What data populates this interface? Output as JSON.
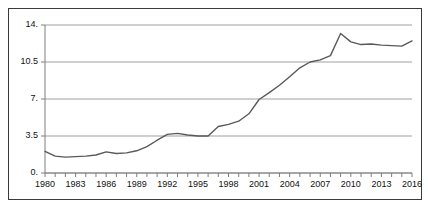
{
  "chart_data": {
    "type": "line",
    "title": "",
    "subtitle": "",
    "xlabel": "",
    "ylabel": "",
    "xlim": [
      1980,
      2016
    ],
    "ylim": [
      0,
      14
    ],
    "grid": true,
    "legend": false,
    "legend_position": "none",
    "line_color": "#595959",
    "gridline_color": "#9f9f9f",
    "axis_color": "#7f7f7f",
    "y_ticks": [
      "0.",
      "3.5",
      "7.",
      "10.5",
      "14."
    ],
    "y_tick_values": [
      0,
      3.5,
      7,
      10.5,
      14
    ],
    "x_ticks": [
      "1980",
      "1983",
      "1986",
      "1989",
      "1992",
      "1995",
      "1998",
      "2001",
      "2004",
      "2007",
      "2010",
      "2013",
      "2016"
    ],
    "x_tick_values": [
      1980,
      1983,
      1986,
      1989,
      1992,
      1995,
      1998,
      2001,
      2004,
      2007,
      2010,
      2013,
      2016
    ],
    "x": [
      1980,
      1981,
      1982,
      1983,
      1984,
      1985,
      1986,
      1987,
      1988,
      1989,
      1990,
      1991,
      1992,
      1993,
      1994,
      1995,
      1996,
      1997,
      1998,
      1999,
      2000,
      2001,
      2002,
      2003,
      2004,
      2005,
      2006,
      2007,
      2008,
      2009,
      2010,
      2011,
      2012,
      2013,
      2014,
      2015,
      2016
    ],
    "values": [
      2.05,
      1.6,
      1.5,
      1.55,
      1.6,
      1.7,
      2.0,
      1.85,
      1.9,
      2.1,
      2.5,
      3.1,
      3.65,
      3.75,
      3.6,
      3.5,
      3.5,
      4.4,
      4.6,
      4.9,
      5.6,
      6.95,
      7.6,
      8.3,
      9.1,
      9.95,
      10.5,
      10.7,
      11.1,
      13.2,
      12.4,
      12.15,
      12.2,
      12.1,
      12.05,
      12.0,
      12.5
    ],
    "series": [
      {
        "name": "value",
        "values": [
          2.05,
          1.6,
          1.5,
          1.55,
          1.6,
          1.7,
          2.0,
          1.85,
          1.9,
          2.1,
          2.5,
          3.1,
          3.65,
          3.75,
          3.6,
          3.5,
          3.5,
          4.4,
          4.6,
          4.9,
          5.6,
          6.95,
          7.6,
          8.3,
          9.1,
          9.95,
          10.5,
          10.7,
          11.1,
          13.2,
          12.4,
          12.15,
          12.2,
          12.1,
          12.05,
          12.0,
          12.5
        ]
      }
    ],
    "annotations": []
  }
}
